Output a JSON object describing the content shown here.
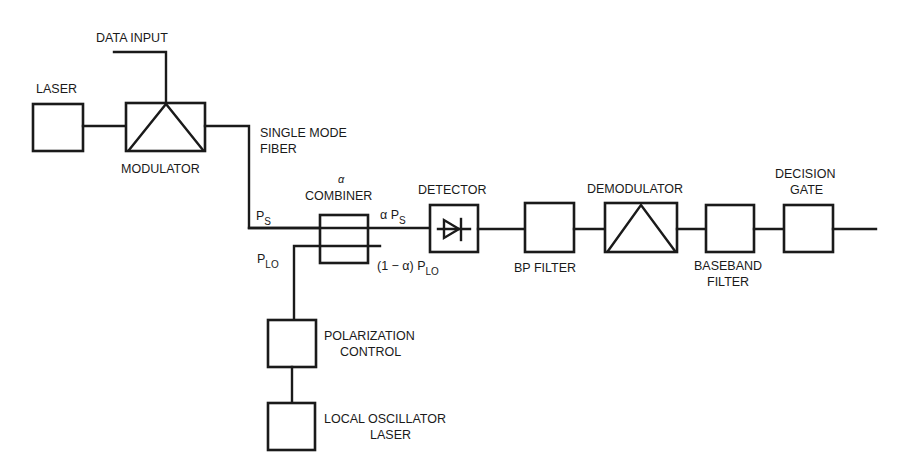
{
  "diagram": {
    "type": "block-diagram",
    "title": "",
    "blocks": [
      {
        "id": "laser",
        "label": "LASER"
      },
      {
        "id": "modulator",
        "label": "MODULATOR"
      },
      {
        "id": "combiner",
        "label": "COMBINER",
        "param": "α"
      },
      {
        "id": "detector",
        "label": "DETECTOR"
      },
      {
        "id": "bp_filter",
        "label": "BP FILTER"
      },
      {
        "id": "demodulator",
        "label": "DEMODULATOR"
      },
      {
        "id": "baseband_filter",
        "label_line1": "BASEBAND",
        "label_line2": "FILTER"
      },
      {
        "id": "decision_gate",
        "label_line1": "DECISION",
        "label_line2": "GATE"
      },
      {
        "id": "polarization_control",
        "label_line1": "POLARIZATION",
        "label_line2": "CONTROL"
      },
      {
        "id": "local_oscillator",
        "label_line1": "LOCAL OSCILLATOR",
        "label_line2": "LASER"
      }
    ],
    "labels": {
      "data_input": "DATA INPUT",
      "fiber_line1": "SINGLE MODE",
      "fiber_line2": "FIBER",
      "ps": "P",
      "ps_sub": "S",
      "plo": "P",
      "plo_sub": "LO",
      "alpha_ps_prefix": "α P",
      "alpha_ps_sub": "S",
      "one_minus_alpha_prefix": "(1 − α) P",
      "one_minus_alpha_sub": "LO",
      "combiner_alpha": "α"
    },
    "connections": [
      [
        "data_input",
        "modulator"
      ],
      [
        "laser",
        "modulator"
      ],
      [
        "modulator",
        "combiner"
      ],
      [
        "local_oscillator",
        "polarization_control"
      ],
      [
        "polarization_control",
        "combiner"
      ],
      [
        "combiner",
        "detector"
      ],
      [
        "detector",
        "bp_filter"
      ],
      [
        "bp_filter",
        "demodulator"
      ],
      [
        "demodulator",
        "baseband_filter"
      ],
      [
        "baseband_filter",
        "decision_gate"
      ],
      [
        "decision_gate",
        "output"
      ]
    ]
  }
}
